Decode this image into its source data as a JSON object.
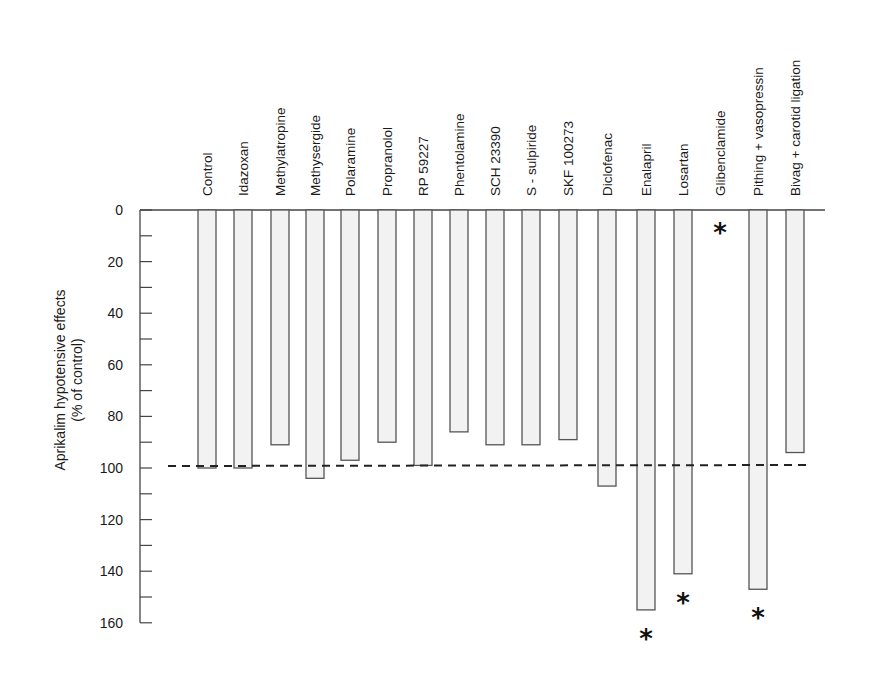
{
  "chart_data": {
    "type": "bar",
    "orientation": "inverted-vertical",
    "title": "",
    "xlabel": "",
    "ylabel": "Aprikalim hypotensive effects",
    "ylabel_line2": "(% of control)",
    "ylim": [
      0,
      160
    ],
    "y_ticks_major": [
      0,
      20,
      40,
      60,
      80,
      100,
      120,
      140,
      160
    ],
    "y_ticks_minor": [
      10,
      30,
      50,
      70,
      90,
      110,
      130,
      150
    ],
    "reference_line": {
      "value": 100,
      "style": "dashed"
    },
    "grid": false,
    "legend": null,
    "categories": [
      "Control",
      "Idazoxan",
      "Methylatropine",
      "Methysergide",
      "Polaramine",
      "Propranolol",
      "RP 59227",
      "Phentolamine",
      "SCH 23390",
      "S - sulpiride",
      "SKF 100273",
      "Diclofenac",
      "Enalapril",
      "Losartan",
      "Glibenclamide",
      "Pithing + vasopressin",
      "Bivag + carotid ligation"
    ],
    "values": [
      100,
      100,
      91,
      104,
      97,
      90,
      99,
      86,
      91,
      91,
      89,
      107,
      155,
      141,
      0,
      147,
      94
    ],
    "significant": [
      false,
      false,
      false,
      false,
      false,
      false,
      false,
      false,
      false,
      false,
      false,
      false,
      true,
      true,
      true,
      true,
      false
    ],
    "annotation_symbol": "*",
    "bar_fill": "#f2f2f2",
    "bar_stroke": "#555555"
  }
}
